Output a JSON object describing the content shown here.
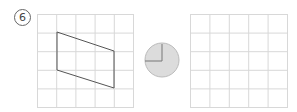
{
  "problem": {
    "number_label": "6",
    "left_grid": {
      "cols": 5,
      "rows": 5
    },
    "shape": {
      "type": "parallelogram",
      "vertices_grid": [
        [
          1,
          1
        ],
        [
          4,
          2
        ],
        [
          4,
          4
        ],
        [
          1,
          3
        ]
      ]
    },
    "protractor_hint": {
      "type": "circle-with-right-angle",
      "fill": "#dcdcdc"
    },
    "right_grid": {
      "cols": 5,
      "rows": 5
    },
    "grid_color": "#d8d8d8",
    "line_color": "#555555"
  }
}
